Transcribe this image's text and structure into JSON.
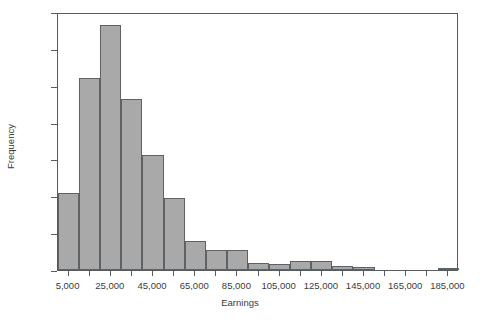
{
  "chart_data": {
    "type": "bar",
    "title": "",
    "subtitle": "",
    "xlabel": "Earnings",
    "ylabel": "Frequency",
    "grid": false,
    "legend": false,
    "ylim": [
      0,
      350
    ],
    "xlim": [
      0,
      190000
    ],
    "bin_width": 10000,
    "y_ticks": [
      0,
      50,
      100,
      150,
      200,
      250,
      300,
      350
    ],
    "y_tick_labels": [
      "0",
      "50",
      "100",
      "150",
      "200",
      "250",
      "300",
      "350"
    ],
    "x_ticks": [
      5000,
      15000,
      25000,
      35000,
      45000,
      55000,
      65000,
      75000,
      85000,
      95000,
      105000,
      115000,
      125000,
      135000,
      145000,
      155000,
      165000,
      175000,
      185000
    ],
    "x_tick_labels": [
      "5,000",
      "",
      "25,000",
      "",
      "45,000",
      "",
      "65,000",
      "",
      "85,000",
      "",
      "105,000",
      "",
      "125,000",
      "",
      "145,000",
      "",
      "165,000",
      "",
      "185,000"
    ],
    "bin_centers": [
      5000,
      15000,
      25000,
      35000,
      45000,
      55000,
      65000,
      75000,
      85000,
      95000,
      105000,
      115000,
      125000,
      135000,
      145000,
      155000,
      165000,
      175000,
      185000
    ],
    "bin_starts": [
      0,
      10000,
      20000,
      30000,
      40000,
      50000,
      60000,
      70000,
      80000,
      90000,
      100000,
      110000,
      120000,
      130000,
      140000,
      150000,
      160000,
      170000,
      180000
    ],
    "categories": [
      "5,000",
      "15,000",
      "25,000",
      "35,000",
      "45,000",
      "55,000",
      "65,000",
      "75,000",
      "85,000",
      "95,000",
      "105,000",
      "115,000",
      "125,000",
      "135,000",
      "145,000",
      "155,000",
      "165,000",
      "175,000",
      "185,000"
    ],
    "values": [
      104,
      261,
      332,
      232,
      156,
      98,
      40,
      27,
      27,
      9,
      8,
      12,
      12,
      6,
      4,
      0,
      0,
      0,
      2
    ],
    "bar_color": "#a9a9a9",
    "bar_edge_color": "#5d6365",
    "axis_color": "#555b5e",
    "background_color": "#ffffff"
  }
}
